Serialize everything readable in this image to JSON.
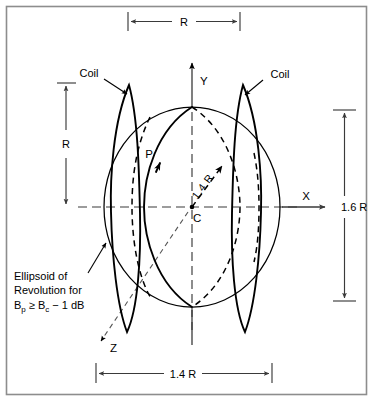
{
  "figure": {
    "type": "technical-diagram",
    "title_visible": false,
    "background_color": "#ffffff",
    "frame_color": "#8d8d8d",
    "line_color": "#000000",
    "dimension_color": "#3a3a3a"
  },
  "axes": {
    "x_label": "X",
    "y_label": "Y",
    "z_label": "Z",
    "center_label": "C"
  },
  "annotations": {
    "coil_left": "Coil",
    "coil_right": "Coil",
    "point_p": "P",
    "radius_diagonal": "1.4 R"
  },
  "dimensions": {
    "top": "R",
    "left": "R",
    "right": "1.6 R",
    "bottom": "1.4 R"
  },
  "caption": {
    "line1": "Ellipsoid of",
    "line2": "Revolution for",
    "line3_lead": "B",
    "line3_sub1": "p",
    "line3_rel": " ≥ B",
    "line3_sub2": "c",
    "line3_tail": " − 1 dB",
    "full_text": "Ellipsoid of Revolution for Bp ≥ Bc − 1 dB"
  },
  "geometry": {
    "center": {
      "x": 192,
      "y": 207
    },
    "ellipsoid": {
      "rx": 88,
      "ry": 100
    },
    "coil_left": {
      "cx": 123,
      "rx": 14,
      "ry": 124
    },
    "coil_right": {
      "cx": 248,
      "rx": 14,
      "ry": 124
    },
    "meridian_solid": {
      "cx": 163,
      "rx": 31,
      "ry": 100
    },
    "meridian_dashed": {
      "cx": 215,
      "rx": 31,
      "ry": 100
    }
  }
}
